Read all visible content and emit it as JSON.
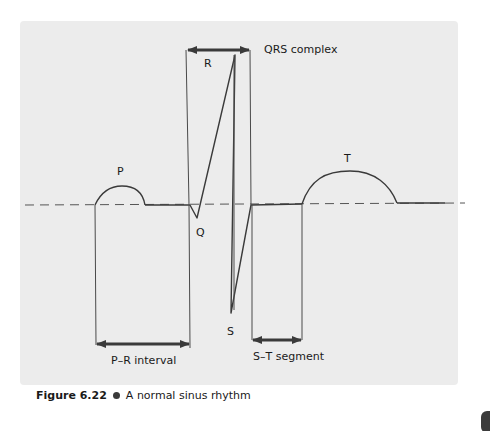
{
  "figure": {
    "number": "Figure 6.22",
    "caption": "A normal sinus rhythm",
    "background_color": "#ececec",
    "line_color": "#3a3a3a"
  },
  "waves": {
    "p": "P",
    "q": "Q",
    "r": "R",
    "s": "S",
    "t": "T"
  },
  "annotations": {
    "qrs_complex": "QRS complex",
    "pr_interval": "P–R interval",
    "st_segment": "S–T segment"
  }
}
